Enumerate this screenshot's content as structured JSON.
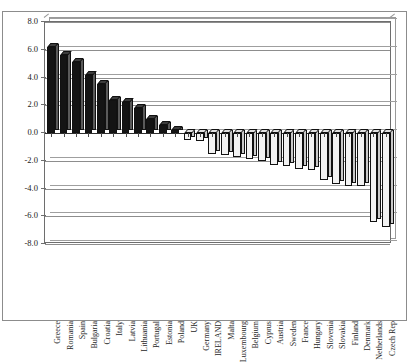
{
  "chart_data": {
    "type": "bar",
    "title": "",
    "xlabel": "",
    "ylabel": "",
    "ylim": [
      -8.0,
      8.0
    ],
    "yticks": [
      "8.0",
      "6.0",
      "4.0",
      "2.0",
      "0.0",
      "-2.0",
      "-4.0",
      "-6.0",
      "-8.0"
    ],
    "ytick_values": [
      8.0,
      6.0,
      4.0,
      2.0,
      0.0,
      -2.0,
      -4.0,
      -6.0,
      -8.0
    ],
    "grid": true,
    "legend": "none",
    "style": "3d-column-excel",
    "categories": [
      "Greece",
      "Romania",
      "Spain",
      "Bulgaria",
      "Croatia",
      "Italy",
      "Latvia",
      "Lithuania",
      "Portugal",
      "Estonia",
      "Poland",
      "UK",
      "Germany",
      "IRELAND",
      "Malta",
      "Luxembourg",
      "Belgium",
      "Cyprus",
      "Austria",
      "Sweden",
      "France",
      "Hungary",
      "Slovenia",
      "Slovakia",
      "Finland",
      "Denmark",
      "Netherlands",
      "Czech Rep"
    ],
    "values": [
      6.2,
      5.6,
      5.1,
      4.2,
      3.5,
      2.4,
      2.2,
      1.8,
      1.0,
      0.6,
      0.2,
      -0.5,
      -0.6,
      -1.5,
      -1.6,
      -1.7,
      -1.9,
      -2.0,
      -2.3,
      -2.4,
      -2.6,
      -2.7,
      -3.4,
      -3.7,
      -3.8,
      -3.8,
      -6.4,
      -6.8
    ],
    "positive_color": "#141414",
    "negative_color": "#f2f2f2",
    "axis_color": "#6e6e6e",
    "grid_color": "#8d8d8d"
  }
}
